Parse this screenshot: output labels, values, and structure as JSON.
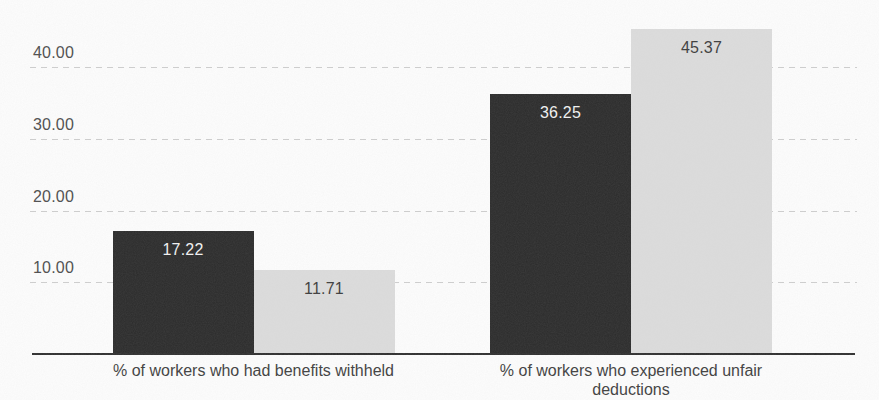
{
  "chart_data": {
    "type": "bar",
    "title": "",
    "categories": [
      "% of workers who had benefits withheld",
      "% of workers who experienced unfair deductions"
    ],
    "series": [
      {
        "name": "dark-series",
        "color": "#2b2b2b",
        "label_color": "#f2f2f2",
        "values": [
          17.22,
          36.25
        ],
        "value_labels": [
          "17.22",
          "36.25"
        ]
      },
      {
        "name": "light-series",
        "color": "#dcdcdc",
        "label_color": "#3c3c3c",
        "values": [
          11.71,
          45.37
        ],
        "value_labels": [
          "11.71",
          "45.37"
        ]
      }
    ],
    "y_ticks": [
      {
        "label": "40.00",
        "value": 40
      },
      {
        "label": "30.00",
        "value": 30
      },
      {
        "label": "20.00",
        "value": 20
      },
      {
        "label": "10.00",
        "value": 10
      }
    ],
    "ylim": [
      0,
      49.4
    ],
    "xlabel": "",
    "ylabel": "",
    "grid": "dashed-horizontal",
    "legend": "none",
    "value_labels_position": "inside-top",
    "colors": {
      "axis_line": "#2f2f2f",
      "gridline": "#c6c6c6",
      "tick_text": "#4d4d4d",
      "category_text": "#3f3f3f",
      "background": "#fdfdfd"
    }
  }
}
